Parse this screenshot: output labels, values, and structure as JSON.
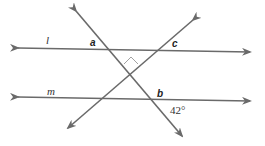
{
  "diagram": {
    "type": "geometry-parallel-lines-transversals",
    "line_color": "#6a6a6a",
    "lines": [
      {
        "name": "l",
        "label": "l",
        "x1": 18,
        "y1": 48,
        "x2": 250,
        "y2": 52
      },
      {
        "name": "m",
        "label": "m",
        "x1": 18,
        "y1": 97,
        "x2": 250,
        "y2": 101
      },
      {
        "name": "transversal-1",
        "label": "",
        "x1": 76,
        "y1": 11,
        "x2": 182,
        "y2": 136
      },
      {
        "name": "transversal-2",
        "label": "",
        "x1": 193,
        "y1": 20,
        "x2": 68,
        "y2": 128
      }
    ],
    "labels": {
      "l": "l",
      "m": "m",
      "a": "a",
      "b": "b",
      "c": "c",
      "angle": "42°"
    },
    "right_angle_marker": true
  }
}
